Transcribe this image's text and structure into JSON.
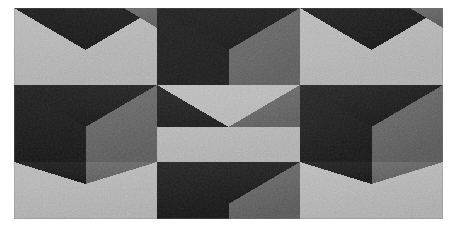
{
  "artwork": {
    "title": "Tumbling Blocks Optical Pattern",
    "description": "Monochrome geometric op-art panel of interlocking cube / chevron tiles in three flat tones, printed with a visible film-grain speckle texture and surrounded by a white paper margin.",
    "medium_note": "grainy halftone print",
    "orientation": "landscape"
  },
  "canvas": {
    "width": 457,
    "height": 237,
    "background_color": "#ffffff"
  },
  "panel": {
    "x": 14,
    "y": 8,
    "width": 429,
    "height": 211,
    "border_color": "#8c8c8c",
    "margin_color": "#ffffff"
  },
  "palette": {
    "light": "#b2b2b2",
    "medium": "#5c5c5c",
    "dark": "#191919",
    "light_name": "light-gray-face",
    "medium_name": "mid-gray-face",
    "dark_name": "near-black-face"
  },
  "grid": {
    "columns": 3,
    "rows": 3,
    "cell_width": 143,
    "cell_height": 77,
    "row_offsets_px": [
      0,
      0,
      0
    ],
    "column_boundaries_px": [
      14,
      157,
      300,
      443
    ],
    "row_boundaries_px": [
      8,
      85,
      162,
      219
    ],
    "notes": "Middle row is phase-shifted one half-cell horizontally relative to the top and bottom rows, producing the tumbling-blocks illusion."
  },
  "chart_data": {
    "type": "heatmap",
    "title": "Tumbling Blocks Optical Pattern",
    "xlabel": "",
    "ylabel": "",
    "categories": [
      "col-1",
      "col-2",
      "col-3"
    ],
    "rows": [
      "row-1",
      "row-2",
      "row-3"
    ],
    "legend": [
      "light",
      "medium",
      "dark"
    ],
    "tiles": [
      {
        "id": "tile-r1c1",
        "row": 1,
        "col": 1,
        "phase": "offset",
        "top_face": "dark",
        "left_face": "light",
        "right_face": "light"
      },
      {
        "id": "tile-r1c2",
        "row": 1,
        "col": 2,
        "phase": "aligned",
        "top_face": "dark",
        "left_face": "dark",
        "right_face": "medium"
      },
      {
        "id": "tile-r1c3",
        "row": 1,
        "col": 3,
        "phase": "offset",
        "top_face": "dark",
        "left_face": "light",
        "right_face": "light"
      },
      {
        "id": "tile-r2c1",
        "row": 2,
        "col": 1,
        "phase": "aligned",
        "top_face": "dark",
        "left_face": "dark",
        "right_face": "medium"
      },
      {
        "id": "tile-r2c2",
        "row": 2,
        "col": 2,
        "phase": "offset",
        "top_face": "dark",
        "left_face": "light",
        "right_face": "light"
      },
      {
        "id": "tile-r2c3",
        "row": 2,
        "col": 3,
        "phase": "aligned",
        "top_face": "dark",
        "left_face": "dark",
        "right_face": "medium"
      },
      {
        "id": "tile-r3c1",
        "row": 3,
        "col": 1,
        "phase": "offset",
        "top_face": "dark",
        "left_face": "light",
        "right_face": "light"
      },
      {
        "id": "tile-r3c2",
        "row": 3,
        "col": 2,
        "phase": "aligned",
        "top_face": "dark",
        "left_face": "dark",
        "right_face": "medium"
      },
      {
        "id": "tile-r3c3",
        "row": 3,
        "col": 3,
        "phase": "offset",
        "top_face": "dark",
        "left_face": "light",
        "right_face": "light"
      }
    ],
    "values": [
      [
        1,
        3,
        1
      ],
      [
        3,
        1,
        3
      ],
      [
        1,
        3,
        1
      ]
    ],
    "value_legend": {
      "1": "light-dominant tile",
      "3": "dark-dominant tile"
    },
    "grid_on": false,
    "legend_position": "none"
  },
  "texture": {
    "grain_opacity": 0.4,
    "speckle_opacity": 0.22,
    "vignette": true
  }
}
